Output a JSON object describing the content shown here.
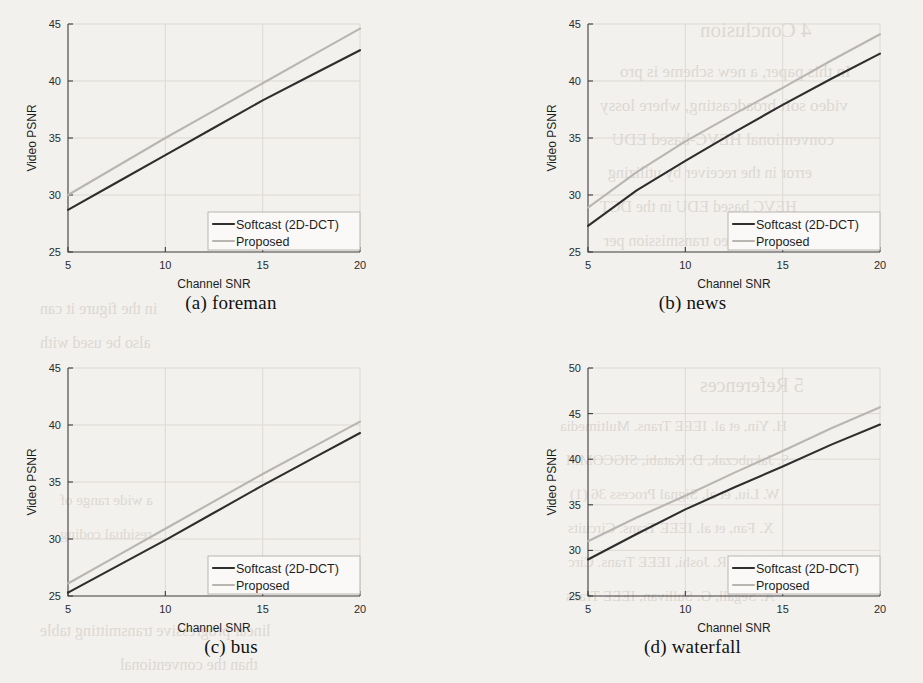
{
  "figure": {
    "background_color": "#f3f1ee",
    "series_colors": {
      "softcast": "#2e2e2e",
      "proposed": "#b9b6b2"
    },
    "legend_entries": [
      "Softcast (2D-DCT)",
      "Proposed"
    ],
    "axis_labels": {
      "x": "Channel SNR",
      "y": "Video PSNR"
    }
  },
  "bleed_text": [
    {
      "text": "4  Conclusion",
      "x": 700,
      "y": 18,
      "size": 21
    },
    {
      "text": "In this paper, a new scheme is pro",
      "x": 620,
      "y": 62,
      "size": 17
    },
    {
      "text": "video soft broadcasting, where lossy",
      "x": 600,
      "y": 96,
      "size": 17
    },
    {
      "text": "conventional HEVC-based EDU",
      "x": 612,
      "y": 130,
      "size": 17
    },
    {
      "text": "error in  the receiver  by utilizing",
      "x": 608,
      "y": 164,
      "size": 16
    },
    {
      "text": "HEVC  based   EDU   in   the  DCT",
      "x": 600,
      "y": 198,
      "size": 16
    },
    {
      "text": "reduce  the video  transmission per",
      "x": 604,
      "y": 232,
      "size": 16
    },
    {
      "text": "5  References",
      "x": 700,
      "y": 374,
      "size": 20
    },
    {
      "text": "H. Yin, et al.  IEEE Trans.  Multimedia",
      "x": 560,
      "y": 418,
      "size": 15
    },
    {
      "text": "S. Jakubczak, D. Katabi,  SIGCOMM",
      "x": 566,
      "y": 452,
      "size": 15
    },
    {
      "text": "W. Liu, et al.  Signal  Process  36 (1)",
      "x": 570,
      "y": 486,
      "size": 15
    },
    {
      "text": "X. Fan, et al.  IEEE  Trans.  Circuits",
      "x": 568,
      "y": 520,
      "size": 15
    },
    {
      "text": "J. Xu,  R. Joshi,  IEEE  Trans.  Circ",
      "x": 568,
      "y": 554,
      "size": 15
    },
    {
      "text": "A. Segall,  G. Sullivan,  IEEE  Trans",
      "x": 566,
      "y": 588,
      "size": 15
    },
    {
      "text": "linear progressive transmitting table",
      "x": 40,
      "y": 622,
      "size": 16
    },
    {
      "text": "than the conventional",
      "x": 120,
      "y": 656,
      "size": 16
    },
    {
      "text": "in the figure it can",
      "x": 40,
      "y": 300,
      "size": 16
    },
    {
      "text": "also  be used  with",
      "x": 40,
      "y": 334,
      "size": 16
    },
    {
      "text": "a  wide  range  of",
      "x": 60,
      "y": 492,
      "size": 15
    },
    {
      "text": "residual  coding",
      "x": 60,
      "y": 526,
      "size": 15
    }
  ],
  "chart_data": [
    {
      "id": "foreman",
      "type": "line",
      "panel_label": "(a) foreman",
      "title": "",
      "xlabel": "Channel SNR",
      "ylabel": "Video PSNR",
      "xlim": [
        5,
        20
      ],
      "ylim": [
        25,
        45
      ],
      "xticks": [
        5,
        10,
        15,
        20
      ],
      "yticks": [
        25,
        30,
        35,
        40,
        45
      ],
      "grid": true,
      "legend_position": "lower right",
      "x": [
        5,
        7.5,
        10,
        12.5,
        15,
        17.5,
        20
      ],
      "series": [
        {
          "name": "Softcast (2D-DCT)",
          "color": "#2e2e2e",
          "values": [
            28.7,
            31.1,
            33.5,
            35.9,
            38.3,
            40.5,
            42.7
          ]
        },
        {
          "name": "Proposed",
          "color": "#b9b6b2",
          "values": [
            30.0,
            32.5,
            35.0,
            37.4,
            39.8,
            42.2,
            44.6
          ]
        }
      ]
    },
    {
      "id": "news",
      "type": "line",
      "panel_label": "(b) news",
      "title": "",
      "xlabel": "Channel SNR",
      "ylabel": "Video PSNR",
      "xlim": [
        5,
        20
      ],
      "ylim": [
        25,
        45
      ],
      "xticks": [
        5,
        10,
        15,
        20
      ],
      "yticks": [
        25,
        30,
        35,
        40,
        45
      ],
      "grid": true,
      "legend_position": "lower right",
      "x": [
        5,
        7.5,
        10,
        12.5,
        15,
        17.5,
        20
      ],
      "series": [
        {
          "name": "Softcast (2D-DCT)",
          "color": "#2e2e2e",
          "values": [
            27.3,
            30.4,
            33.0,
            35.5,
            37.9,
            40.2,
            42.4
          ]
        },
        {
          "name": "Proposed",
          "color": "#b9b6b2",
          "values": [
            28.9,
            32.0,
            34.7,
            37.1,
            39.4,
            41.8,
            44.1
          ]
        }
      ]
    },
    {
      "id": "bus",
      "type": "line",
      "panel_label": "(c) bus",
      "title": "",
      "xlabel": "Channel SNR",
      "ylabel": "Video PSNR",
      "xlim": [
        5,
        20
      ],
      "ylim": [
        25,
        45
      ],
      "xticks": [
        5,
        10,
        15,
        20
      ],
      "yticks": [
        25,
        30,
        35,
        40,
        45
      ],
      "grid": true,
      "legend_position": "lower right",
      "x": [
        5,
        7.5,
        10,
        12.5,
        15,
        17.5,
        20
      ],
      "series": [
        {
          "name": "Softcast (2D-DCT)",
          "color": "#2e2e2e",
          "values": [
            25.3,
            27.6,
            29.9,
            32.3,
            34.7,
            37.0,
            39.3
          ]
        },
        {
          "name": "Proposed",
          "color": "#b9b6b2",
          "values": [
            26.1,
            28.5,
            30.9,
            33.3,
            35.7,
            38.0,
            40.3
          ]
        }
      ]
    },
    {
      "id": "waterfall",
      "type": "line",
      "panel_label": "(d) waterfall",
      "title": "",
      "xlabel": "Channel SNR",
      "ylabel": "Video PSNR",
      "xlim": [
        5,
        20
      ],
      "ylim": [
        25,
        50
      ],
      "xticks": [
        5,
        10,
        15,
        20
      ],
      "yticks": [
        25,
        30,
        35,
        40,
        45,
        50
      ],
      "grid": true,
      "legend_position": "lower right",
      "x": [
        5,
        7.5,
        10,
        12.5,
        15,
        17.5,
        20
      ],
      "series": [
        {
          "name": "Softcast (2D-DCT)",
          "color": "#2e2e2e",
          "values": [
            29.0,
            31.8,
            34.5,
            36.9,
            39.2,
            41.6,
            43.8
          ]
        },
        {
          "name": "Proposed",
          "color": "#b9b6b2",
          "values": [
            31.0,
            33.6,
            36.0,
            38.5,
            40.9,
            43.4,
            45.7
          ]
        }
      ]
    }
  ]
}
